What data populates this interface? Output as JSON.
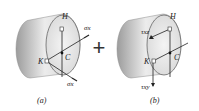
{
  "panels": [
    {
      "id": "a",
      "caption": "(a)",
      "points": {
        "top": "H",
        "left": "K",
        "center": "C"
      },
      "stress_top": "σx",
      "stress_top_sub": "",
      "stress_bottom": "σx"
    },
    {
      "id": "b",
      "caption": "(b)",
      "points": {
        "top": "H",
        "left": "K",
        "center": "C"
      },
      "stress_top": "τxz",
      "stress_bottom": "τxy"
    }
  ],
  "operator": "+",
  "colors": {
    "cylinder_dark": "#a9a9a9",
    "cylinder_light": "#f2f2f2",
    "face": "#e6e6e6",
    "line": "#222222"
  }
}
